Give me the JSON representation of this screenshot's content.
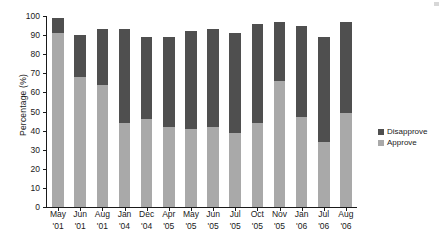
{
  "chart_data": {
    "type": "bar",
    "subtype": "stacked-vertical",
    "title": "",
    "xlabel": "",
    "ylabel": "Percentage  (%)",
    "ylim": [
      0,
      100
    ],
    "yticks": [
      0,
      10,
      20,
      30,
      40,
      50,
      60,
      70,
      80,
      90,
      100
    ],
    "grid": false,
    "legend_position": "right",
    "categories": [
      "May '01",
      "Jun '01",
      "Aug '01",
      "Jan '04",
      "Dec '04",
      "Apr '05",
      "May '05",
      "Jun '05",
      "Jul '05",
      "Oct '05",
      "Nov '05",
      "Jan '06",
      "Jul '06",
      "Aug '06"
    ],
    "category_months": [
      "May",
      "Jun",
      "Aug",
      "Jan",
      "Dec",
      "Apr",
      "May",
      "Jun",
      "Jul",
      "Oct",
      "Nov",
      "Jan",
      "Jul",
      "Aug"
    ],
    "category_years": [
      "'01",
      "'01",
      "'01",
      "'04",
      "'04",
      "'05",
      "'05",
      "'05",
      "'05",
      "'05",
      "'05",
      "'06",
      "'06",
      "'06"
    ],
    "series": [
      {
        "name": "Approve",
        "color": "#a9a9a9",
        "values": [
          91,
          68,
          64,
          44,
          46,
          42,
          41,
          42,
          39,
          44,
          66,
          47,
          34,
          49
        ]
      },
      {
        "name": "Disapprove",
        "color": "#4f4f4f",
        "values": [
          8,
          22,
          29,
          49,
          43,
          47,
          51,
          51,
          52,
          52,
          31,
          48,
          55,
          48
        ]
      }
    ],
    "totals": [
      99,
      90,
      93,
      93,
      89,
      89,
      92,
      93,
      91,
      96,
      97,
      95,
      89,
      97
    ]
  },
  "legend": {
    "items": [
      {
        "label": "Disapprove",
        "color": "#4f4f4f"
      },
      {
        "label": "Approve",
        "color": "#a9a9a9"
      }
    ]
  }
}
